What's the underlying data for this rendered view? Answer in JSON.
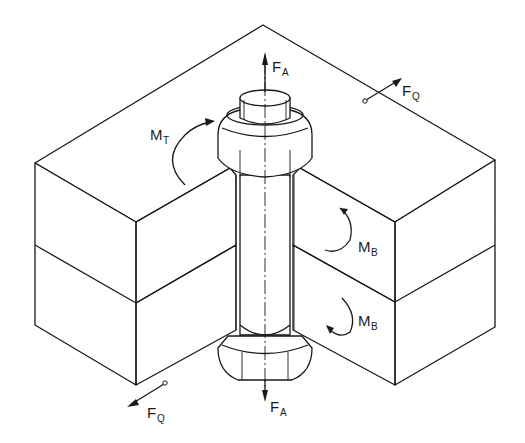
{
  "figure": {
    "colors": {
      "line": "#1a1a1a",
      "background": "#ffffff"
    }
  },
  "labels": {
    "axial_force_top": {
      "main": "F",
      "sub": "A"
    },
    "axial_force_bottom": {
      "main": "F",
      "sub": "A"
    },
    "transverse_force_top": {
      "main": "F",
      "sub": "Q"
    },
    "transverse_force_bottom": {
      "main": "F",
      "sub": "Q"
    },
    "torque": {
      "main": "M",
      "sub": "T"
    },
    "bending_moment_upper": {
      "main": "M",
      "sub": "B"
    },
    "bending_moment_lower": {
      "main": "M",
      "sub": "B"
    }
  }
}
